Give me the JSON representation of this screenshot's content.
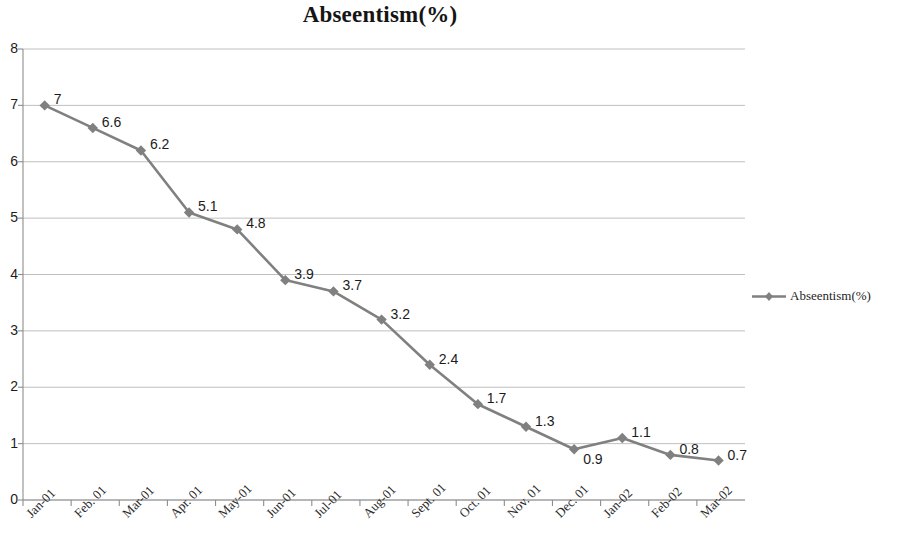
{
  "chart_data": {
    "type": "line",
    "title": "Abseentism(%)",
    "xlabel": "",
    "ylabel": "",
    "ylim": [
      0,
      8
    ],
    "ytick_step": 1,
    "grid": true,
    "grid_axis": "y",
    "legend_position": "right",
    "series_color": "#808080",
    "marker": "diamond",
    "categories": [
      "Jan-01",
      "Feb. 01",
      "Mar-01",
      "Apr. 01",
      "May-01",
      "Jun-01",
      "Jul-01",
      "Aug-01",
      "Sept. 01",
      "Oct. 01",
      "Nov. 01",
      "Dec. 01",
      "Jan-02",
      "Feb-02",
      "Mar-02"
    ],
    "ytick_labels": [
      "8",
      "7",
      "6",
      "5",
      "4",
      "3",
      "2",
      "1",
      "0"
    ],
    "series": [
      {
        "name": "Abseentism(%)",
        "values": [
          7,
          6.6,
          6.2,
          5.1,
          4.8,
          3.9,
          3.7,
          3.2,
          2.4,
          1.7,
          1.3,
          0.9,
          1.1,
          0.8,
          0.7
        ],
        "data_labels": [
          "7",
          "6.6",
          "6.2",
          "5.1",
          "4.8",
          "3.9",
          "3.7",
          "3.2",
          "2.4",
          "1.7",
          "1.3",
          "0.9",
          "1.1",
          "0.8",
          "0.7"
        ]
      }
    ],
    "legend": [
      {
        "label": "Abseentism(%)",
        "color": "#808080"
      }
    ]
  }
}
